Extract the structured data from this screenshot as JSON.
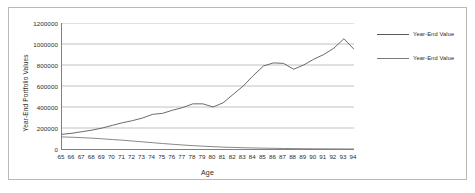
{
  "chart_data": {
    "type": "line",
    "title": "",
    "xlabel": "Age",
    "ylabel": "Year-End Portfolio Values",
    "xlim": [
      65,
      94
    ],
    "ylim": [
      0,
      1200000
    ],
    "ytick_labels": [
      "1200000",
      "1000000",
      "800000",
      "600000",
      "400000",
      "200000",
      "0"
    ],
    "ytick_values": [
      1200000,
      1000000,
      800000,
      600000,
      400000,
      200000,
      0
    ],
    "grid": true,
    "legend_position": "right",
    "categories": [
      65,
      66,
      67,
      68,
      69,
      70,
      71,
      72,
      73,
      74,
      75,
      76,
      77,
      78,
      79,
      80,
      81,
      82,
      83,
      84,
      85,
      86,
      87,
      88,
      89,
      90,
      91,
      92,
      93,
      94
    ],
    "series": [
      {
        "name": "Year-End Value",
        "color": "#59595c",
        "values": [
          140000,
          150000,
          165000,
          180000,
          200000,
          225000,
          250000,
          270000,
          295000,
          330000,
          340000,
          370000,
          395000,
          430000,
          430000,
          400000,
          440000,
          520000,
          600000,
          700000,
          790000,
          820000,
          815000,
          760000,
          800000,
          855000,
          900000,
          960000,
          1050000,
          950000
        ]
      },
      {
        "name": "Year-End Value",
        "color": "#7a7a7d",
        "values": [
          115000,
          112000,
          108000,
          103000,
          97000,
          90000,
          84000,
          76000,
          68000,
          60000,
          52000,
          45000,
          38000,
          32000,
          27000,
          22000,
          18000,
          15000,
          12000,
          10000,
          8000,
          6500,
          5000,
          4000,
          3000,
          2200,
          1600,
          1100,
          700,
          400
        ]
      }
    ],
    "legend": [
      {
        "label": "Year-End Value"
      },
      {
        "label": "Year-End Value"
      }
    ]
  }
}
